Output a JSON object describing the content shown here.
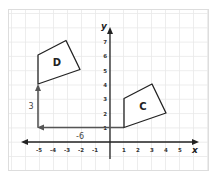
{
  "diagram": {
    "type": "coordinate-plane-translation",
    "axes": {
      "x_label": "x",
      "y_label": "y",
      "x_ticks": [
        "-5",
        "-4",
        "-3",
        "-2",
        "-1",
        "1",
        "2",
        "3",
        "4",
        "5"
      ],
      "y_ticks": [
        "1",
        "2",
        "3",
        "4",
        "5",
        "6",
        "7"
      ]
    },
    "shapes": [
      {
        "label": "C",
        "vertices": [
          [
            1,
            1
          ],
          [
            1,
            3
          ],
          [
            3,
            4
          ],
          [
            4,
            2
          ]
        ]
      },
      {
        "label": "D",
        "vertices": [
          [
            -5,
            4
          ],
          [
            -5,
            6
          ],
          [
            -3,
            7
          ],
          [
            -2,
            5
          ]
        ]
      }
    ],
    "translation_arrows": [
      {
        "label": "-6",
        "from": [
          1,
          1
        ],
        "to": [
          -5,
          1
        ],
        "direction": "horizontal"
      },
      {
        "label": "3",
        "from": [
          -5,
          1
        ],
        "to": [
          -5,
          4
        ],
        "direction": "vertical"
      }
    ],
    "colors": {
      "grid": "#e6e6e6",
      "axis": "#222222",
      "shape_stroke": "#222222",
      "arrow": "#555555",
      "frame": "#dddddd"
    }
  }
}
